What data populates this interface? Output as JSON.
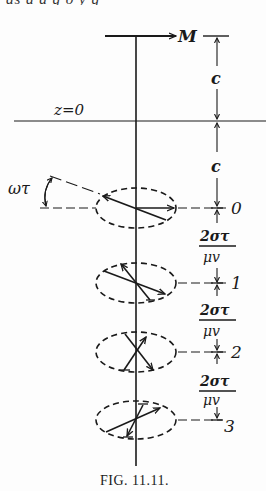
{
  "clipped_top_text": "as a  a  g  o  y  g",
  "labels": {
    "magnetization": "M",
    "plane": "z=0",
    "angle": "ωτ",
    "distance_c_upper": "c",
    "distance_c_lower": "c",
    "fraction_num": "2στ",
    "fraction_den": "μv"
  },
  "levels": [
    {
      "index": "0"
    },
    {
      "index": "1"
    },
    {
      "index": "2"
    },
    {
      "index": "3"
    }
  ],
  "fractions": [
    {
      "num": "2στ",
      "den": "μv"
    },
    {
      "num": "2στ",
      "den": "μv"
    },
    {
      "num": "2στ",
      "den": "μv"
    }
  ],
  "caption": "FIG. 11.11.",
  "colors": {
    "ink": "#1a1a1a",
    "paper": "#fdfdfd"
  }
}
